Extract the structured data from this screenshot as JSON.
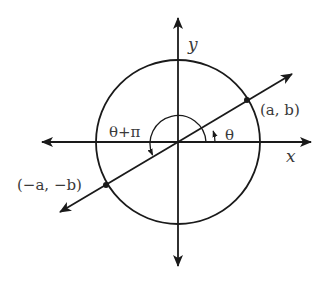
{
  "diagram": {
    "title": "",
    "axes": {
      "x_label": "x",
      "y_label": "y"
    },
    "points": [
      {
        "name": "point-a-b",
        "label": "(a, b)"
      },
      {
        "name": "point-neg-a-neg-b",
        "label": "(−a, −b)"
      }
    ],
    "angles": [
      {
        "name": "angle-theta",
        "label": "θ"
      },
      {
        "name": "angle-theta-plus-pi",
        "label": "θ+π"
      }
    ],
    "colors": {
      "stroke": "#1a1a1a",
      "text": "#3a3a3a",
      "background": "#ffffff"
    }
  }
}
